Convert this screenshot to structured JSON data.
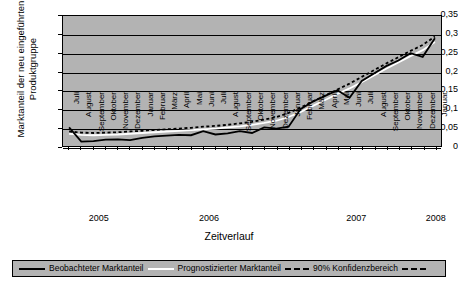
{
  "chart_data": {
    "type": "line",
    "title": "",
    "ylabel": "Marktanteil der neu eingeführten Produktgruppe",
    "ylabel_line1": "Marktanteil der neu eingeführten",
    "ylabel_line2": "Produktgruppe",
    "xlabel": "Zeitverlauf",
    "ylim": [
      0,
      0.35
    ],
    "ytick_labels": [
      "0,35",
      "0,3",
      "0,25",
      "0,2",
      "0,15",
      "0,1",
      "0,05",
      "0"
    ],
    "ytick_values": [
      0.35,
      0.3,
      0.25,
      0.2,
      0.15,
      0.1,
      0.05,
      0
    ],
    "grid": true,
    "legend_position": "bottom",
    "plot_background": "#b3b3b3",
    "categories": [
      "Juli",
      "August",
      "September",
      "Oktober",
      "November",
      "Dezember",
      "Januar",
      "Februar",
      "März",
      "April",
      "Mai",
      "Juni",
      "Juli",
      "August",
      "September",
      "Oktober",
      "November",
      "Dezember",
      "Januar",
      "Februar",
      "März",
      "April",
      "Mai",
      "Juni",
      "Juli",
      "August",
      "September",
      "Oktober",
      "November",
      "Dezember",
      "Januar"
    ],
    "year_groups": [
      {
        "label": "2005",
        "start_index": 0,
        "end_index": 5
      },
      {
        "label": "2006",
        "start_index": 6,
        "end_index": 17
      },
      {
        "label": "2007",
        "start_index": 18,
        "end_index": 29
      },
      {
        "label": "2008",
        "start_index": 30,
        "end_index": 30
      }
    ],
    "series": [
      {
        "name": "Beobachteter Marktanteil",
        "style": "solid",
        "color": "#000000",
        "values": [
          0.05,
          0.012,
          0.013,
          0.017,
          0.018,
          0.016,
          0.022,
          0.026,
          0.028,
          0.03,
          0.029,
          0.04,
          0.031,
          0.034,
          0.04,
          0.035,
          0.05,
          0.047,
          0.052,
          0.1,
          0.12,
          0.135,
          0.15,
          0.13,
          0.175,
          0.195,
          0.215,
          0.23,
          0.25,
          0.24,
          0.29
        ]
      },
      {
        "name": "Prognostizierter Marktanteil",
        "style": "solid",
        "color": "#ffffff",
        "values": [
          0.033,
          0.03,
          0.029,
          0.03,
          0.031,
          0.033,
          0.035,
          0.037,
          0.039,
          0.041,
          0.043,
          0.045,
          0.047,
          0.05,
          0.053,
          0.057,
          0.062,
          0.068,
          0.078,
          0.092,
          0.108,
          0.124,
          0.14,
          0.155,
          0.172,
          0.19,
          0.208,
          0.225,
          0.242,
          0.258,
          0.28
        ]
      },
      {
        "name": "90% Konfidenzbereich",
        "style": "dashed",
        "color": "#000000",
        "values": [
          0.039,
          0.036,
          0.035,
          0.036,
          0.037,
          0.039,
          0.041,
          0.043,
          0.045,
          0.047,
          0.049,
          0.052,
          0.054,
          0.057,
          0.061,
          0.065,
          0.071,
          0.078,
          0.089,
          0.104,
          0.12,
          0.136,
          0.152,
          0.168,
          0.186,
          0.204,
          0.222,
          0.239,
          0.256,
          0.272,
          0.295
        ]
      }
    ]
  },
  "legend": {
    "items": [
      {
        "label": "Beobachteter Marktanteil",
        "key": "solid-black"
      },
      {
        "label": "Prognostizierter Marktanteil",
        "key": "solid-white"
      },
      {
        "label": "90% Konfidenzbereich",
        "key": "dashed-black"
      }
    ]
  }
}
